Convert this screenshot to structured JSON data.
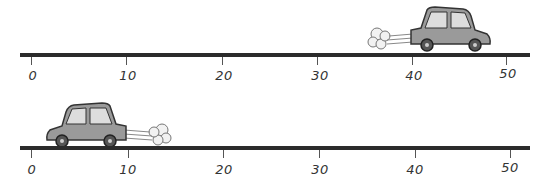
{
  "diagram": {
    "tracks": [
      {
        "name": "top-track",
        "car_direction": "right",
        "car_position_label": "40",
        "tick_labels": [
          "0",
          "10",
          "20",
          "30",
          "40",
          "50"
        ]
      },
      {
        "name": "bottom-track",
        "car_direction": "left",
        "car_position_label": "5",
        "tick_labels": [
          "0",
          "10",
          "20",
          "30",
          "40",
          "50"
        ]
      }
    ],
    "colors": {
      "line": "#2b2b2b",
      "car_body": "#9a9a9a",
      "text": "#333333"
    }
  }
}
